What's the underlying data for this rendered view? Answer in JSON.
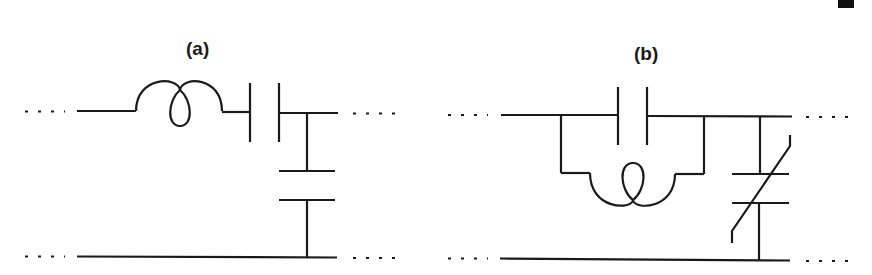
{
  "figure": {
    "panels": [
      {
        "id": "a",
        "label": "(a)",
        "description": "Series inductor and capacitor on top line, shunt capacitor to bottom line",
        "components": [
          {
            "type": "inductor",
            "placement": "series"
          },
          {
            "type": "capacitor",
            "placement": "series"
          },
          {
            "type": "capacitor",
            "placement": "shunt"
          }
        ]
      },
      {
        "id": "b",
        "label": "(b)",
        "description": "Parallel capacitor-inductor tank in series on top line, shunt variable capacitor to bottom line",
        "components": [
          {
            "type": "capacitor",
            "placement": "series-parallel-branch"
          },
          {
            "type": "inductor",
            "placement": "series-parallel-branch"
          },
          {
            "type": "variable-capacitor",
            "placement": "shunt"
          }
        ]
      }
    ],
    "corner_mark": "black-rectangle"
  },
  "colors": {
    "ink": "#1a1a1a",
    "background": "#ffffff"
  }
}
